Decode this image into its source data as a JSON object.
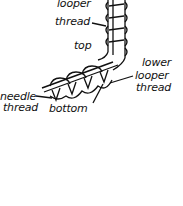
{
  "diagram": {
    "labels": {
      "upper_looper_1": "looper",
      "upper_looper_2": "thread",
      "top": "top",
      "lower_looper_1": "lower",
      "lower_looper_2": "looper",
      "lower_looper_3": "thread",
      "needle_1": "needle",
      "needle_2": "thread",
      "bottom": "bottom"
    },
    "colors": {
      "ink": "#111111",
      "background": "#ffffff"
    }
  }
}
